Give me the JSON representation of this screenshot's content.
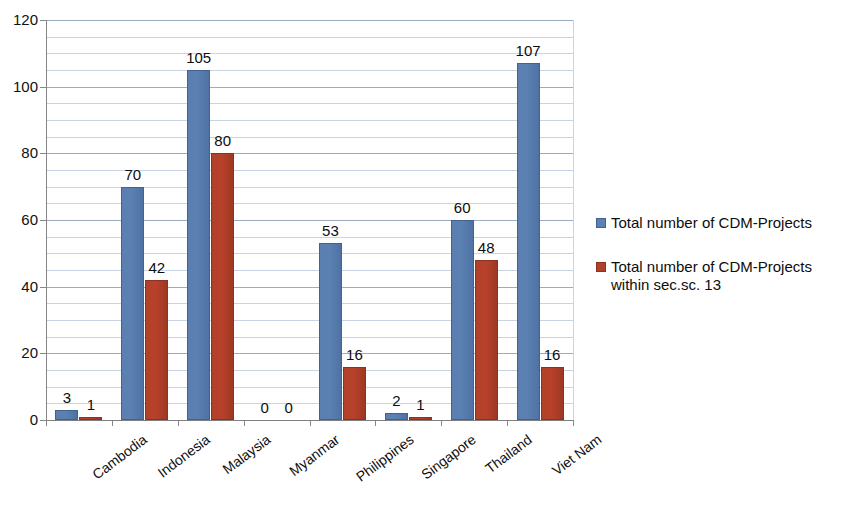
{
  "chart_data": {
    "type": "bar",
    "title": "",
    "subtitle": "",
    "xlabel": "",
    "ylabel": "",
    "ylim": [
      0,
      120
    ],
    "ytick_values": [
      0,
      20,
      40,
      60,
      80,
      100,
      120
    ],
    "ytick_labels": [
      "0",
      "20",
      "40",
      "60",
      "80",
      "100",
      "120"
    ],
    "minor_gridline_step": 5,
    "grid": true,
    "legend_position": "right",
    "categories": [
      "Cambodia",
      "Indonesia",
      "Malaysia",
      "Myanmar",
      "Philippines",
      "Singapore",
      "Thailand",
      "Viet Nam"
    ],
    "series": [
      {
        "name": "Total number of CDM-Projects",
        "color": "#5b80b2",
        "values": [
          3,
          70,
          105,
          0,
          53,
          2,
          60,
          107
        ],
        "labels": [
          "3",
          "70",
          "105",
          "0",
          "53",
          "2",
          "60",
          "107"
        ]
      },
      {
        "name": "Total number of CDM-Projects within sec.sc. 13",
        "color": "#b0412a",
        "values": [
          1,
          42,
          80,
          0,
          16,
          1,
          48,
          16
        ],
        "labels": [
          "1",
          "42",
          "80",
          "0",
          "16",
          "1",
          "48",
          "16"
        ]
      }
    ]
  },
  "legend": {
    "entries": [
      {
        "label": "Total number of CDM-Projects",
        "color": "#5b80b2",
        "swatch_name": "legend-swatch-series-0"
      },
      {
        "label": "Total number of CDM-Projects within sec.sc. 13",
        "color": "#b0412a",
        "swatch_name": "legend-swatch-series-1"
      }
    ]
  }
}
